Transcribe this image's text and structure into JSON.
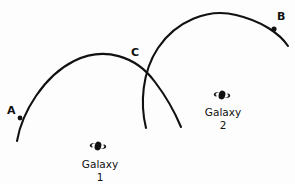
{
  "figure": {
    "background_color": "#fdfdfd",
    "ink_color": "#111111",
    "width": 295,
    "height": 184
  },
  "points": [
    {
      "id": "A",
      "label": "A",
      "marker": "dot",
      "x": 20,
      "y": 118
    },
    {
      "id": "B",
      "label": "B",
      "marker": "dot",
      "x": 274,
      "y": 29
    },
    {
      "id": "C",
      "label": "C",
      "marker": "crossing",
      "x": 143,
      "y": 70
    }
  ],
  "arcs": [
    {
      "id": "arc-galaxy-1",
      "name": "galaxy-1-arc",
      "from_point": "A",
      "through_point": "C",
      "start": [
        17,
        141
      ],
      "apex": [
        88,
        57
      ],
      "end": [
        181,
        127
      ]
    },
    {
      "id": "arc-galaxy-2",
      "name": "galaxy-2-arc",
      "from_point": "C",
      "to_point": "B",
      "start": [
        146,
        128
      ],
      "apex": [
        212,
        12
      ],
      "end": [
        288,
        46
      ]
    }
  ],
  "galaxies": [
    {
      "id": "galaxy-1",
      "name": "Galaxy",
      "number": "1",
      "glyph": "spiral-galaxy-icon",
      "glyph_x": 98,
      "glyph_y": 146,
      "label_x": 100,
      "label_y": 160
    },
    {
      "id": "galaxy-2",
      "name": "Galaxy",
      "number": "2",
      "glyph": "spiral-galaxy-icon",
      "glyph_x": 222,
      "glyph_y": 95,
      "label_x": 223,
      "label_y": 108
    }
  ]
}
